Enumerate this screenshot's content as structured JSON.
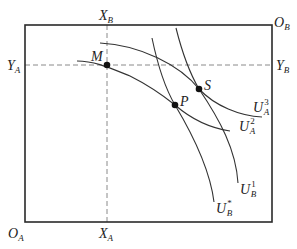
{
  "diagram": {
    "type": "edgeworth-box",
    "origins": {
      "A": {
        "label": "O",
        "sub": "A"
      },
      "B": {
        "label": "O",
        "sub": "B"
      }
    },
    "axis_marks": {
      "x_top": {
        "label": "X",
        "sub": "B"
      },
      "x_bottom": {
        "label": "X",
        "sub": "A"
      },
      "y_left": {
        "label": "Y",
        "sub": "A"
      },
      "y_right": {
        "label": "Y",
        "sub": "B"
      }
    },
    "points": [
      {
        "id": "M",
        "label": "M"
      },
      {
        "id": "P",
        "label": "P"
      },
      {
        "id": "S",
        "label": "S"
      }
    ],
    "curves": {
      "UA3": {
        "label": "U",
        "sub": "A",
        "sup": "3"
      },
      "UA2": {
        "label": "U",
        "sub": "A",
        "sup": "2"
      },
      "UB1": {
        "label": "U",
        "sub": "B",
        "sup": "1"
      },
      "UBstar": {
        "label": "U",
        "sub": "B",
        "sup": "*"
      }
    },
    "colors": {
      "box": "#2a2a2a",
      "curve": "#333333",
      "dashed": "#8a8a8a",
      "point": "#111111"
    }
  }
}
